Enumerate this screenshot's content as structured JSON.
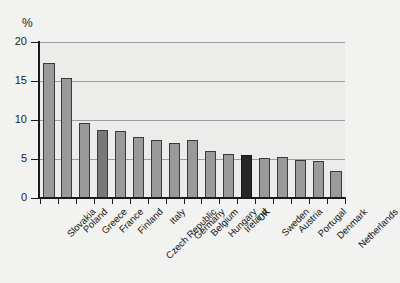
{
  "chart_data": {
    "type": "bar",
    "title": "",
    "subtitle": "",
    "xlabel": "",
    "ylabel": "%",
    "ylim": [
      0,
      20
    ],
    "yticks": [
      0,
      5,
      10,
      15,
      20
    ],
    "ytick_labels": [
      "0",
      "5",
      "10",
      "15",
      "20"
    ],
    "grid": true,
    "legend": "none",
    "categories": [
      "Slovakia",
      "Poland",
      "Greece",
      "France",
      "Finland",
      "Czech Republic",
      "Italy",
      "Germany",
      "Belgium",
      "Hungary",
      "Ireland",
      "UK",
      "Sweden",
      "Austria",
      "Portugal",
      "Denmark",
      "Netherlands"
    ],
    "values": [
      17.3,
      15.4,
      9.6,
      8.7,
      8.6,
      7.8,
      7.5,
      7.1,
      7.4,
      6.0,
      5.6,
      5.5,
      5.1,
      5.2,
      4.9,
      4.8,
      3.5
    ],
    "bar_styles": [
      "light",
      "light",
      "light",
      "mid",
      "light",
      "light",
      "light",
      "light",
      "light",
      "light",
      "light",
      "dark",
      "light",
      "light",
      "light",
      "light",
      "light"
    ],
    "colors": {
      "bar_light": "#9a9a9a",
      "bar_mid": "#787878",
      "bar_dark": "#262626",
      "bar_edge": "#3a3a3a",
      "plot_background": "#ececea",
      "page_background": "#f2f2f0",
      "gridline": "#9d9d9d",
      "axis": "#1a1a1a",
      "text": "#141414"
    }
  }
}
